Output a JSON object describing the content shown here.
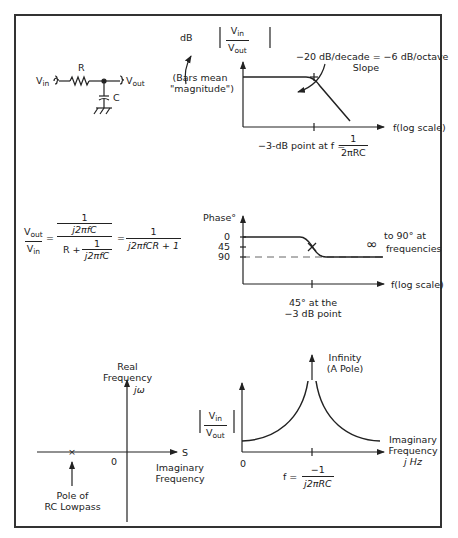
{
  "circuit": {
    "vin_label": "V",
    "vin_sub": "in",
    "vout_label": "V",
    "vout_sub": "out",
    "resistor_label": "R",
    "capacitor_label": "C"
  },
  "magnitude_plot": {
    "ylabel_prefix": "dB",
    "ylabel_num": "V",
    "ylabel_num_sub": "in",
    "ylabel_den": "V",
    "ylabel_den_sub": "out",
    "bars_note_line1": "(Bars mean",
    "bars_note_line2": "\"magnitude\")",
    "slope_line1": "−20 dB/decade = −6 dB/octave",
    "slope_line2": "Slope",
    "xlabel": "f(log scale)",
    "corner_text": "−3-dB point at f =",
    "corner_num": "1",
    "corner_den": "2πRC"
  },
  "transfer_equation": {
    "lhs_num": "V",
    "lhs_num_sub": "out",
    "lhs_den": "V",
    "lhs_den_sub": "in",
    "mid_num_num": "1",
    "mid_num_den": "j2πfC",
    "mid_den_prefix": "R +",
    "mid_den_num": "1",
    "mid_den_den": "j2πfC",
    "rhs_num": "1",
    "rhs_den": "j2πfCR + 1",
    "equals": "="
  },
  "phase_plot": {
    "ylabel": "Phase°",
    "ticks": [
      "0",
      "45",
      "90"
    ],
    "note_line1": "to 90° at",
    "note_symbol": "∞",
    "note_line2": "frequencies",
    "xlabel": "f(log scale)",
    "caption_line1": "45° at the",
    "caption_line2": "−3 dB point"
  },
  "s_plane": {
    "real_line1": "Real",
    "real_line2": "Frequency",
    "jw_label": "jω",
    "s_label": "S",
    "origin": "0",
    "imag_line1": "Imaginary",
    "imag_line2": "Frequency",
    "pole_marker": "×",
    "pole_line1": "Pole of",
    "pole_line2": "RC Lowpass"
  },
  "pole_plot": {
    "ylabel_num": "V",
    "ylabel_num_sub": "in",
    "ylabel_den": "V",
    "ylabel_den_sub": "out",
    "infinity_line1": "Infinity",
    "infinity_line2": "(A Pole)",
    "origin": "0",
    "x_line1": "Imaginary",
    "x_line2": "Frequency",
    "x_line3": "j Hz",
    "f_prefix": "f =",
    "f_num": "−1",
    "f_den": "j2πRC"
  }
}
